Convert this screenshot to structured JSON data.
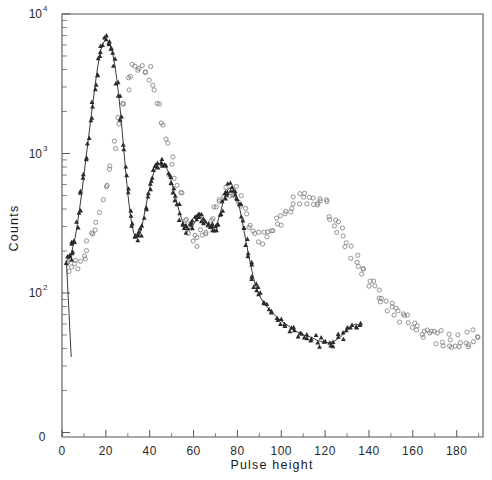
{
  "figure": {
    "background": "#ffffff",
    "frame_color": "#555555"
  },
  "chart_data": {
    "type": "scatter",
    "title": "",
    "xlabel": "Pulse height",
    "ylabel": "Counts",
    "yscale": "log",
    "xscale": "linear",
    "xlim": [
      0,
      192
    ],
    "ylim": [
      20,
      10000
    ],
    "grid": false,
    "legend_position": "none",
    "xticks": [
      0,
      20,
      40,
      60,
      80,
      100,
      120,
      140,
      160,
      180
    ],
    "xticklabels": [
      "0",
      "20",
      "40",
      "60",
      "80",
      "100",
      "120",
      "140",
      "160",
      "180"
    ],
    "xminor_ticks": [
      10,
      30,
      50,
      70,
      90,
      110,
      130,
      150,
      170,
      190
    ],
    "yticks": [
      100,
      1000,
      10000
    ],
    "yticklabels": [
      "10²",
      "10³",
      "10⁴"
    ],
    "yticklabel_mantissa": [
      "10",
      "10",
      "10"
    ],
    "yticklabel_exponent": [
      "2",
      "3",
      "4"
    ],
    "y_origin_label": "0",
    "yminor_decades": [
      2,
      3,
      4
    ],
    "series": [
      {
        "name": "triangles",
        "marker": "triangle",
        "color": "#2b2b2b",
        "has_fit_curve": true,
        "points": [
          [
            2,
            170
          ],
          [
            3,
            175
          ],
          [
            4,
            182
          ],
          [
            4.5,
            200
          ],
          [
            5,
            215
          ],
          [
            6,
            250
          ],
          [
            7,
            310
          ],
          [
            8,
            400
          ],
          [
            9,
            520
          ],
          [
            10,
            700
          ],
          [
            11,
            950
          ],
          [
            12,
            1250
          ],
          [
            13,
            1700
          ],
          [
            14,
            2250
          ],
          [
            15,
            3000
          ],
          [
            16,
            3900
          ],
          [
            17,
            4900
          ],
          [
            18,
            5800
          ],
          [
            19,
            6300
          ],
          [
            20,
            6500
          ],
          [
            21,
            6400
          ],
          [
            22,
            6000
          ],
          [
            23,
            5300
          ],
          [
            24,
            4400
          ],
          [
            25,
            3400
          ],
          [
            26,
            2500
          ],
          [
            27,
            1750
          ],
          [
            28,
            1150
          ],
          [
            29,
            760
          ],
          [
            30,
            520
          ],
          [
            31,
            380
          ],
          [
            32,
            300
          ],
          [
            33,
            260
          ],
          [
            34,
            250
          ],
          [
            35,
            255
          ],
          [
            36,
            280
          ],
          [
            37,
            330
          ],
          [
            38,
            400
          ],
          [
            39,
            480
          ],
          [
            40,
            570
          ],
          [
            41,
            660
          ],
          [
            42,
            740
          ],
          [
            43,
            800
          ],
          [
            44,
            840
          ],
          [
            45,
            855
          ],
          [
            46,
            850
          ],
          [
            47,
            820
          ],
          [
            48,
            770
          ],
          [
            49,
            700
          ],
          [
            50,
            620
          ],
          [
            51,
            540
          ],
          [
            52,
            470
          ],
          [
            53,
            410
          ],
          [
            54,
            360
          ],
          [
            55,
            325
          ],
          [
            56,
            300
          ],
          [
            57,
            290
          ],
          [
            58,
            288
          ],
          [
            59,
            295
          ],
          [
            60,
            310
          ],
          [
            61,
            330
          ],
          [
            62,
            345
          ],
          [
            63,
            350
          ],
          [
            64,
            345
          ],
          [
            65,
            330
          ],
          [
            66,
            315
          ],
          [
            67,
            300
          ],
          [
            68,
            292
          ],
          [
            69,
            290
          ],
          [
            70,
            300
          ],
          [
            71,
            325
          ],
          [
            72,
            365
          ],
          [
            73,
            420
          ],
          [
            74,
            480
          ],
          [
            75,
            530
          ],
          [
            76,
            560
          ],
          [
            77,
            570
          ],
          [
            78,
            560
          ],
          [
            79,
            525
          ],
          [
            80,
            470
          ],
          [
            81,
            405
          ],
          [
            82,
            340
          ],
          [
            83,
            280
          ],
          [
            84,
            230
          ],
          [
            85,
            190
          ],
          [
            86,
            160
          ],
          [
            87,
            135
          ],
          [
            88,
            118
          ],
          [
            89,
            105
          ],
          [
            90,
            96
          ],
          [
            92,
            85
          ],
          [
            94,
            78
          ],
          [
            96,
            72
          ],
          [
            98,
            67
          ],
          [
            100,
            63
          ],
          [
            102,
            60
          ],
          [
            104,
            57
          ],
          [
            106,
            54
          ],
          [
            108,
            52
          ],
          [
            110,
            50
          ],
          [
            112,
            49
          ],
          [
            114,
            48
          ],
          [
            116,
            46
          ],
          [
            118,
            45
          ],
          [
            120,
            44
          ],
          [
            122,
            44
          ],
          [
            124,
            45
          ],
          [
            126,
            47
          ],
          [
            128,
            50
          ],
          [
            130,
            54
          ],
          [
            132,
            58
          ],
          [
            134,
            60
          ],
          [
            136,
            58
          ]
        ]
      },
      {
        "name": "circles",
        "marker": "open-circle",
        "color": "#7a7a7a",
        "has_fit_curve": false,
        "points": [
          [
            2,
            150
          ],
          [
            4,
            155
          ],
          [
            6,
            160
          ],
          [
            8,
            170
          ],
          [
            10,
            185
          ],
          [
            12,
            210
          ],
          [
            14,
            250
          ],
          [
            16,
            310
          ],
          [
            18,
            410
          ],
          [
            20,
            560
          ],
          [
            22,
            780
          ],
          [
            24,
            1100
          ],
          [
            26,
            1600
          ],
          [
            28,
            2300
          ],
          [
            30,
            3100
          ],
          [
            32,
            3900
          ],
          [
            34,
            4300
          ],
          [
            36,
            4400
          ],
          [
            38,
            4200
          ],
          [
            40,
            3700
          ],
          [
            42,
            3000
          ],
          [
            44,
            2300
          ],
          [
            46,
            1700
          ],
          [
            48,
            1250
          ],
          [
            50,
            900
          ],
          [
            52,
            650
          ],
          [
            54,
            480
          ],
          [
            56,
            370
          ],
          [
            58,
            300
          ],
          [
            60,
            260
          ],
          [
            62,
            245
          ],
          [
            64,
            255
          ],
          [
            66,
            290
          ],
          [
            68,
            350
          ],
          [
            70,
            420
          ],
          [
            72,
            490
          ],
          [
            74,
            540
          ],
          [
            76,
            560
          ],
          [
            78,
            550
          ],
          [
            80,
            510
          ],
          [
            82,
            450
          ],
          [
            84,
            385
          ],
          [
            86,
            330
          ],
          [
            88,
            290
          ],
          [
            90,
            265
          ],
          [
            92,
            255
          ],
          [
            94,
            260
          ],
          [
            96,
            280
          ],
          [
            98,
            310
          ],
          [
            100,
            350
          ],
          [
            102,
            390
          ],
          [
            104,
            430
          ],
          [
            106,
            460
          ],
          [
            108,
            480
          ],
          [
            110,
            490
          ],
          [
            112,
            495
          ],
          [
            114,
            490
          ],
          [
            116,
            475
          ],
          [
            118,
            450
          ],
          [
            120,
            420
          ],
          [
            122,
            380
          ],
          [
            124,
            340
          ],
          [
            126,
            300
          ],
          [
            128,
            265
          ],
          [
            130,
            230
          ],
          [
            132,
            200
          ],
          [
            134,
            175
          ],
          [
            136,
            152
          ],
          [
            138,
            135
          ],
          [
            140,
            120
          ],
          [
            142,
            108
          ],
          [
            144,
            98
          ],
          [
            146,
            90
          ],
          [
            148,
            83
          ],
          [
            150,
            77
          ],
          [
            152,
            72
          ],
          [
            154,
            68
          ],
          [
            156,
            64
          ],
          [
            158,
            61
          ],
          [
            160,
            58
          ],
          [
            162,
            56
          ],
          [
            164,
            54
          ],
          [
            166,
            52
          ],
          [
            168,
            50
          ],
          [
            170,
            49
          ],
          [
            172,
            48
          ],
          [
            174,
            47
          ],
          [
            176,
            46
          ],
          [
            178,
            46
          ],
          [
            180,
            45
          ],
          [
            182,
            45
          ],
          [
            184,
            46
          ],
          [
            186,
            47
          ],
          [
            188,
            48
          ],
          [
            190,
            50
          ]
        ]
      }
    ],
    "fit_curve_note": "smooth oscillating fit through triangle series",
    "annotations": []
  }
}
